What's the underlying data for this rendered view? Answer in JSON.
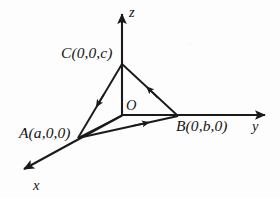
{
  "figure": {
    "background_color": "#fdfdfd",
    "ink_color": "#1a1a1a",
    "axes": [
      {
        "name": "x",
        "label": "x",
        "label_x": 33,
        "label_y": 178
      },
      {
        "name": "y",
        "label": "y",
        "label_x": 252,
        "label_y": 119
      },
      {
        "name": "z",
        "label": "z",
        "label_x": 129,
        "label_y": 5
      }
    ],
    "origin": {
      "label": "O",
      "label_x": 126,
      "label_y": 98
    },
    "points": [
      {
        "name": "A",
        "label": "A(a,0,0)",
        "label_x": 19,
        "label_y": 125
      },
      {
        "name": "B",
        "label": "B(0,b,0)",
        "label_x": 176,
        "label_y": 118
      },
      {
        "name": "C",
        "label": "C(0,0,c)",
        "label_x": 61,
        "label_y": 45
      }
    ],
    "geometry": {
      "origin_px": [
        122,
        115
      ],
      "point_A_px": [
        78,
        138
      ],
      "point_B_px": [
        178,
        116
      ],
      "point_C_px": [
        122,
        63
      ],
      "x_axis_tip_px": [
        21,
        172
      ],
      "y_axis_tip_px": [
        268,
        115
      ],
      "z_axis_tip_px": [
        122,
        11
      ]
    },
    "edges": [
      {
        "name": "edge-C-to-A",
        "from": "C",
        "to": "A",
        "arrow": "midpoint-toward-A"
      },
      {
        "name": "edge-B-to-C",
        "from": "B",
        "to": "C",
        "arrow": "midpoint-toward-C"
      },
      {
        "name": "edge-A-to-B",
        "from": "A",
        "to": "B",
        "arrow": "midpoint-toward-B"
      },
      {
        "name": "edge-A-to-O",
        "from": "A",
        "to": "O",
        "arrow": "none"
      }
    ]
  }
}
